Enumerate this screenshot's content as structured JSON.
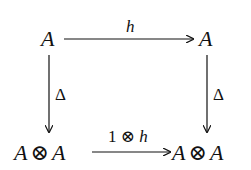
{
  "diagram": {
    "type": "commutative-square",
    "nodes": {
      "top_left": "A",
      "top_right": "A",
      "bottom_left": {
        "left": "A",
        "op": "⊗",
        "right": "A"
      },
      "bottom_right": {
        "left": "A",
        "op": "⊗",
        "right": "A"
      }
    },
    "arrows": {
      "top": {
        "from": "top_left",
        "to": "top_right",
        "label": "h"
      },
      "left": {
        "from": "top_left",
        "to": "bottom_left",
        "label": "Δ"
      },
      "right": {
        "from": "top_right",
        "to": "bottom_right",
        "label": "Δ"
      },
      "bottom": {
        "from": "bottom_left",
        "to": "bottom_right",
        "label_parts": {
          "one": "1",
          "op": "⊗",
          "h": "h"
        }
      }
    },
    "stroke_color": "#111111",
    "background": "#ffffff"
  }
}
